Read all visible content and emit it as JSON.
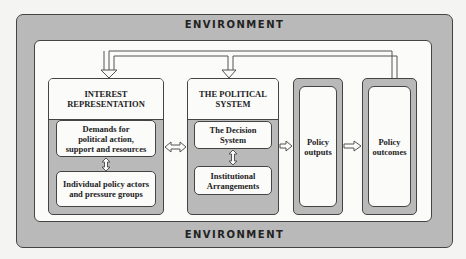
{
  "environment": {
    "top_label": "ENVIRONMENT",
    "bottom_label": "ENVIRONMENT"
  },
  "interest_representation": {
    "title_line1": "INTEREST",
    "title_line2": "REPRESENTATION",
    "demands": {
      "line1": "Demands for",
      "line2": "political action,",
      "line3": "support and resources"
    },
    "actors": {
      "line1": "Individual policy actors",
      "line2": "and pressure groups"
    }
  },
  "political_system": {
    "title_line1": "THE POLITICAL",
    "title_line2": "SYSTEM",
    "decision": {
      "line1": "The Decision",
      "line2": "System"
    },
    "institutional": {
      "line1": "Institutional",
      "line2": "Arrangements"
    }
  },
  "policy_outputs": {
    "line1": "Policy",
    "line2": "outputs"
  },
  "policy_outcomes": {
    "line1": "Policy",
    "line2": "outcomes"
  },
  "colors": {
    "frame_gray": "#b9b9b9",
    "panel_white": "#fbfbfa",
    "outline": "#444444"
  }
}
